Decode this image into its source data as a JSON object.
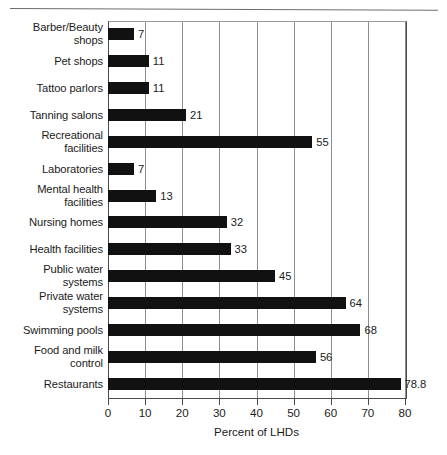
{
  "chart_data": {
    "type": "bar",
    "orientation": "horizontal",
    "title": "",
    "xlabel": "Percent of LHDs",
    "ylabel": "",
    "xlim": [
      0,
      80
    ],
    "xticks": [
      0,
      10,
      20,
      30,
      40,
      50,
      60,
      70,
      80
    ],
    "grid": "vertical",
    "legend": "none",
    "bar_color": "#111111",
    "categories": [
      "Barber/Beauty shops",
      "Pet shops",
      "Tattoo parlors",
      "Tanning salons",
      "Recreational facilities",
      "Laboratories",
      "Mental health facilities",
      "Nursing homes",
      "Health facilities",
      "Public water systems",
      "Private water systems",
      "Swimming pools",
      "Food and milk control",
      "Restaurants"
    ],
    "values": [
      7,
      11,
      11,
      21,
      55,
      7,
      13,
      32,
      33,
      45,
      64,
      68,
      56,
      78.8
    ],
    "data_labels": [
      "7",
      "11",
      "11",
      "21",
      "55",
      "7",
      "13",
      "32",
      "33",
      "45",
      "64",
      "68",
      "56",
      "78.8"
    ]
  },
  "rows": [
    {
      "label_line1": "Barber/Beauty",
      "label_line2": "shops",
      "value": 7,
      "value_label": "7"
    },
    {
      "label_line1": "Pet shops",
      "label_line2": "",
      "value": 11,
      "value_label": "11"
    },
    {
      "label_line1": "Tattoo parlors",
      "label_line2": "",
      "value": 11,
      "value_label": "11"
    },
    {
      "label_line1": "Tanning salons",
      "label_line2": "",
      "value": 21,
      "value_label": "21"
    },
    {
      "label_line1": "Recreational",
      "label_line2": "facilities",
      "value": 55,
      "value_label": "55"
    },
    {
      "label_line1": "Laboratories",
      "label_line2": "",
      "value": 7,
      "value_label": "7"
    },
    {
      "label_line1": "Mental health",
      "label_line2": "facilities",
      "value": 13,
      "value_label": "13"
    },
    {
      "label_line1": "Nursing homes",
      "label_line2": "",
      "value": 32,
      "value_label": "32"
    },
    {
      "label_line1": "Health facilities",
      "label_line2": "",
      "value": 33,
      "value_label": "33"
    },
    {
      "label_line1": "Public water",
      "label_line2": "systems",
      "value": 45,
      "value_label": "45"
    },
    {
      "label_line1": "Private water",
      "label_line2": "systems",
      "value": 64,
      "value_label": "64"
    },
    {
      "label_line1": "Swimming pools",
      "label_line2": "",
      "value": 68,
      "value_label": "68"
    },
    {
      "label_line1": "Food and milk",
      "label_line2": "control",
      "value": 56,
      "value_label": "56"
    },
    {
      "label_line1": "Restaurants",
      "label_line2": "",
      "value": 78.8,
      "value_label": "78.8"
    }
  ],
  "axis": {
    "x_title": "Percent of LHDs",
    "x_tick_labels": [
      "0",
      "10",
      "20",
      "30",
      "40",
      "50",
      "60",
      "70",
      "80"
    ]
  }
}
